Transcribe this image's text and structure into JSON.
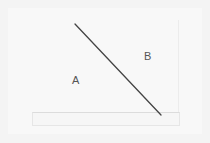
{
  "scene": {
    "description": "Photo of white paper with a diagonal line dividing regions A and B",
    "labels": {
      "a": "A",
      "b": "B"
    },
    "line": {
      "x1": 75,
      "y1": 24,
      "x2": 161,
      "y2": 115,
      "color": "#444444"
    }
  }
}
